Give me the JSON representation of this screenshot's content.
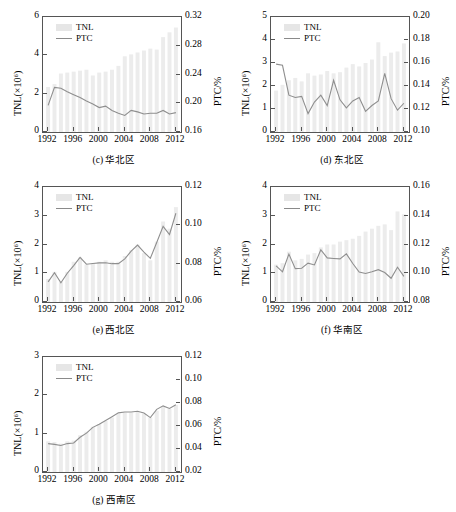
{
  "figure": {
    "panel_count": 5,
    "series_labels": {
      "bars": "TNL",
      "line": "PTC"
    },
    "axis_titles": {
      "left": "TNL(×10⁶)",
      "right": "PTC/%"
    }
  },
  "chart_data": [
    {
      "type": "bar",
      "id": "c",
      "title": "(c) 华北区",
      "caption_label": "(c)",
      "caption_region": "华北区",
      "xlabel": "",
      "ylabel": "TNL(×10⁶)",
      "y2label": "PTC/%",
      "xlim": [
        1991.2,
        2012.8
      ],
      "ylim": [
        0,
        6
      ],
      "y2lim": [
        0.16,
        0.32
      ],
      "yticks": [
        0,
        2,
        4,
        6
      ],
      "y2ticks": [
        0.16,
        0.2,
        0.24,
        0.28,
        0.32
      ],
      "y2ticklabels": [
        "0.16",
        "0.20",
        "0.24",
        "0.28",
        "0.32"
      ],
      "xticks": [
        1992,
        1996,
        2000,
        2004,
        2008,
        2012
      ],
      "grid": false,
      "legend": [
        "TNL",
        "PTC"
      ],
      "legend_position": "upper left",
      "categories": [
        1992,
        1993,
        1994,
        1995,
        1996,
        1997,
        1998,
        1999,
        2000,
        2001,
        2002,
        2003,
        2004,
        2005,
        2006,
        2007,
        2008,
        2009,
        2010,
        2011,
        2012
      ],
      "series": [
        {
          "name": "TNL",
          "type": "bar",
          "axis": "left",
          "values": [
            2.35,
            2.5,
            3.05,
            3.1,
            3.15,
            3.2,
            3.25,
            2.95,
            3.1,
            3.15,
            3.25,
            3.45,
            3.95,
            4.05,
            4.15,
            4.25,
            4.35,
            4.3,
            4.95,
            5.2,
            5.45
          ]
        },
        {
          "name": "PTC",
          "type": "line",
          "axis": "right",
          "values": [
            0.197,
            0.222,
            0.221,
            0.216,
            0.212,
            0.208,
            0.203,
            0.199,
            0.194,
            0.196,
            0.19,
            0.186,
            0.183,
            0.19,
            0.188,
            0.185,
            0.186,
            0.186,
            0.19,
            0.185,
            0.187
          ]
        }
      ]
    },
    {
      "type": "bar",
      "id": "d",
      "title": "(d) 东北区",
      "caption_label": "(d)",
      "caption_region": "东北区",
      "xlabel": "",
      "ylabel": "TNL(×10⁶)",
      "y2label": "PTC/%",
      "xlim": [
        1991.2,
        2012.8
      ],
      "ylim": [
        0,
        5
      ],
      "y2lim": [
        0.1,
        0.2
      ],
      "yticks": [
        0,
        1,
        2,
        3,
        4,
        5
      ],
      "y2ticks": [
        0.1,
        0.12,
        0.14,
        0.16,
        0.18,
        0.2
      ],
      "y2ticklabels": [
        "0.10",
        "0.12",
        "0.14",
        "0.16",
        "0.18",
        "0.20"
      ],
      "xticks": [
        1992,
        1996,
        2000,
        2004,
        2008,
        2012
      ],
      "grid": false,
      "legend": [
        "TNL",
        "PTC"
      ],
      "legend_position": "upper left",
      "categories": [
        1992,
        1993,
        1994,
        1995,
        1996,
        1997,
        1998,
        1999,
        2000,
        2001,
        2002,
        2003,
        2004,
        2005,
        2006,
        2007,
        2008,
        2009,
        2010,
        2011,
        2012
      ],
      "series": [
        {
          "name": "TNL",
          "type": "bar",
          "axis": "left",
          "values": [
            1.8,
            2.05,
            2.25,
            2.35,
            2.2,
            2.55,
            2.45,
            2.5,
            2.65,
            2.55,
            2.6,
            2.8,
            2.95,
            2.85,
            3.0,
            3.15,
            3.9,
            3.3,
            3.45,
            3.5,
            3.85
          ]
        },
        {
          "name": "PTC",
          "type": "line",
          "axis": "right",
          "values": [
            0.159,
            0.158,
            0.132,
            0.13,
            0.131,
            0.116,
            0.126,
            0.132,
            0.123,
            0.145,
            0.128,
            0.121,
            0.127,
            0.13,
            0.118,
            0.123,
            0.127,
            0.151,
            0.129,
            0.119,
            0.125
          ]
        }
      ]
    },
    {
      "type": "bar",
      "id": "e",
      "title": "(e) 西北区",
      "caption_label": "(e)",
      "caption_region": "西北区",
      "xlabel": "",
      "ylabel": "TNL(×10⁶)",
      "y2label": "PTC/%",
      "xlim": [
        1991.2,
        2012.8
      ],
      "ylim": [
        0,
        4
      ],
      "y2lim": [
        0.06,
        0.12
      ],
      "yticks": [
        0,
        1,
        2,
        3,
        4
      ],
      "y2ticks": [
        0.06,
        0.08,
        0.1,
        0.12
      ],
      "y2ticklabels": [
        "0.06",
        "0.08",
        "0.10",
        "0.12"
      ],
      "xticks": [
        1992,
        1996,
        2000,
        2004,
        2008,
        2012
      ],
      "grid": false,
      "legend": [
        "TNL",
        "PTC"
      ],
      "legend_position": "upper left",
      "categories": [
        1992,
        1993,
        1994,
        1995,
        1996,
        1997,
        1998,
        1999,
        2000,
        2001,
        2002,
        2003,
        2004,
        2005,
        2006,
        2007,
        2008,
        2009,
        2010,
        2011,
        2012
      ],
      "series": [
        {
          "name": "TNL",
          "type": "bar",
          "axis": "left",
          "values": [
            0.8,
            1.05,
            0.7,
            1.05,
            1.4,
            1.55,
            1.3,
            1.35,
            1.4,
            1.45,
            1.4,
            1.4,
            1.6,
            1.8,
            2.0,
            1.7,
            1.45,
            2.1,
            2.8,
            2.55,
            3.3
          ]
        },
        {
          "name": "PTC",
          "type": "line",
          "axis": "right",
          "values": [
            0.0705,
            0.0753,
            0.07,
            0.075,
            0.079,
            0.0833,
            0.0797,
            0.0801,
            0.0804,
            0.0805,
            0.08,
            0.08,
            0.0825,
            0.0865,
            0.0897,
            0.086,
            0.0828,
            0.091,
            0.0995,
            0.0952,
            0.1063
          ]
        }
      ]
    },
    {
      "type": "bar",
      "id": "f",
      "title": "(f) 华南区",
      "caption_label": "(f)",
      "caption_region": "华南区",
      "xlabel": "",
      "ylabel": "TNL(×10⁶)",
      "y2label": "PTC/%",
      "xlim": [
        1991.2,
        2012.8
      ],
      "ylim": [
        0,
        4
      ],
      "y2lim": [
        0.08,
        0.16
      ],
      "yticks": [
        0,
        1,
        2,
        3,
        4
      ],
      "y2ticks": [
        0.08,
        0.1,
        0.12,
        0.14,
        0.16
      ],
      "y2ticklabels": [
        "0.08",
        "0.10",
        "0.12",
        "0.14",
        "0.16"
      ],
      "xticks": [
        1992,
        1996,
        2000,
        2004,
        2008,
        2012
      ],
      "grid": false,
      "legend": [
        "TNL",
        "PTC"
      ],
      "legend_position": "upper left",
      "categories": [
        1992,
        1993,
        1994,
        1995,
        1996,
        1997,
        1998,
        1999,
        2000,
        2001,
        2002,
        2003,
        2004,
        2005,
        2006,
        2007,
        2008,
        2009,
        2010,
        2011,
        2012
      ],
      "series": [
        {
          "name": "TNL",
          "type": "bar",
          "axis": "left",
          "values": [
            1.3,
            1.35,
            1.75,
            1.45,
            1.5,
            1.65,
            1.7,
            1.9,
            2.0,
            2.0,
            2.1,
            2.15,
            2.2,
            2.3,
            2.45,
            2.55,
            2.65,
            2.7,
            2.5,
            3.15,
            3.05
          ]
        },
        {
          "name": "PTC",
          "type": "line",
          "axis": "right",
          "values": [
            0.1052,
            0.101,
            0.1133,
            0.1032,
            0.1035,
            0.107,
            0.1058,
            0.1163,
            0.1107,
            0.1103,
            0.11,
            0.1135,
            0.1068,
            0.1008,
            0.0998,
            0.101,
            0.1025,
            0.1005,
            0.0965,
            0.1042,
            0.0978
          ]
        }
      ]
    },
    {
      "type": "bar",
      "id": "g",
      "title": "(g) 西南区",
      "caption_label": "(g)",
      "caption_region": "西南区",
      "xlabel": "",
      "ylabel": "TNL(×10⁶)",
      "y2label": "PTC/%",
      "xlim": [
        1991.2,
        2012.8
      ],
      "ylim": [
        0,
        3
      ],
      "y2lim": [
        0.02,
        0.12
      ],
      "yticks": [
        0,
        1,
        2,
        3
      ],
      "y2ticks": [
        0.02,
        0.04,
        0.06,
        0.08,
        0.1,
        0.12
      ],
      "y2ticklabels": [
        "0.02",
        "0.04",
        "0.06",
        "0.08",
        "0.10",
        "0.12"
      ],
      "xticks": [
        1992,
        1996,
        2000,
        2004,
        2008,
        2012
      ],
      "grid": false,
      "legend": [
        "TNL",
        "PTC"
      ],
      "legend_position": "upper left",
      "categories": [
        1992,
        1993,
        1994,
        1995,
        1996,
        1997,
        1998,
        1999,
        2000,
        2001,
        2002,
        2003,
        2004,
        2005,
        2006,
        2007,
        2008,
        2009,
        2010,
        2011,
        2012
      ],
      "series": [
        {
          "name": "TNL",
          "type": "bar",
          "axis": "left",
          "values": [
            0.8,
            0.78,
            0.74,
            0.8,
            0.82,
            0.96,
            1.05,
            1.18,
            1.25,
            1.33,
            1.42,
            1.52,
            1.55,
            1.55,
            1.57,
            1.52,
            1.42,
            1.6,
            1.7,
            1.65,
            1.75
          ]
        },
        {
          "name": "PTC",
          "type": "line",
          "axis": "right",
          "values": [
            0.0447,
            0.044,
            0.043,
            0.0447,
            0.0452,
            0.0502,
            0.0538,
            0.0588,
            0.0615,
            0.0647,
            0.068,
            0.0714,
            0.0722,
            0.0722,
            0.0728,
            0.0713,
            0.0673,
            0.0745,
            0.0775,
            0.0753,
            0.0785
          ]
        }
      ]
    }
  ]
}
